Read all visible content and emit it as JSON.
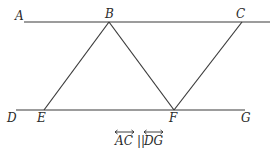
{
  "diagram": {
    "points": {
      "A": {
        "label": "A",
        "x": 24,
        "y": 22
      },
      "B": {
        "label": "B",
        "x": 109,
        "y": 22
      },
      "C": {
        "label": "C",
        "x": 242,
        "y": 22
      },
      "D": {
        "label": "D",
        "x": 16,
        "y": 110
      },
      "E": {
        "label": "E",
        "x": 44,
        "y": 110
      },
      "F": {
        "label": "F",
        "x": 174,
        "y": 110
      },
      "G": {
        "label": "G",
        "x": 245,
        "y": 110
      }
    },
    "segments": [
      [
        "A",
        "C"
      ],
      [
        "D",
        "G"
      ],
      [
        "B",
        "E"
      ],
      [
        "B",
        "F"
      ],
      [
        "C",
        "F"
      ]
    ],
    "caption": {
      "left": "AC",
      "separator": "||",
      "right": "DG"
    }
  }
}
